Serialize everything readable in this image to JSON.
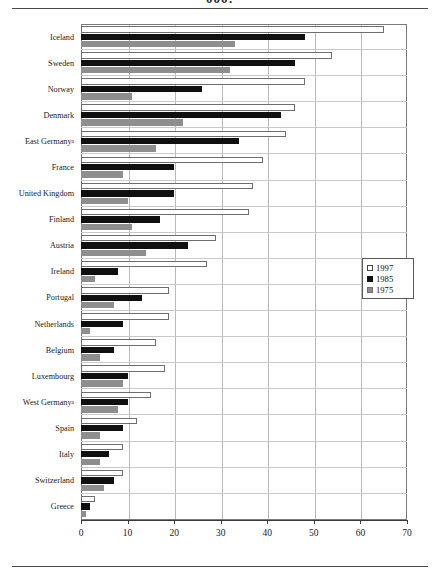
{
  "page": {
    "cropped_caption": "000:"
  },
  "chart_data": {
    "type": "bar",
    "orientation": "horizontal",
    "title": "",
    "xlabel": "",
    "ylabel": "",
    "xlim": [
      0,
      70
    ],
    "xticks": [
      0,
      10,
      20,
      30,
      40,
      50,
      60,
      70
    ],
    "grid": true,
    "legend_position": "right-middle",
    "categories": [
      "Iceland",
      "Sweden",
      "Norway",
      "Denmark",
      "East Germany",
      "France",
      "United Kingdom",
      "Finland",
      "Austria",
      "Ireland",
      "Portugal",
      "Netherlands",
      "Belgium",
      "Luxembourg",
      "West Germany",
      "Spain",
      "Italy",
      "Switzerland",
      "Greece"
    ],
    "category_footnotes": {
      "East Germany": "a",
      "West Germany": "a"
    },
    "series": [
      {
        "name": "1997",
        "color": "#ffffff",
        "values": [
          65,
          54,
          48,
          46,
          44,
          39,
          37,
          36,
          29,
          27,
          19,
          19,
          16,
          18,
          15,
          12,
          9,
          9,
          3
        ]
      },
      {
        "name": "1985",
        "color": "#101010",
        "values": [
          48,
          46,
          26,
          43,
          34,
          20,
          20,
          17,
          23,
          8,
          13,
          9,
          7,
          10,
          10,
          9,
          6,
          7,
          2
        ]
      },
      {
        "name": "1975",
        "color": "#8e8e8e",
        "values": [
          33,
          32,
          11,
          22,
          16,
          9,
          10,
          11,
          14,
          3,
          7,
          2,
          4,
          9,
          8,
          4,
          4,
          5,
          1
        ]
      }
    ]
  },
  "legend": {
    "items": [
      {
        "label": "1997",
        "swatch": "white"
      },
      {
        "label": "1985",
        "swatch": "black"
      },
      {
        "label": "1975",
        "swatch": "gray"
      }
    ]
  }
}
